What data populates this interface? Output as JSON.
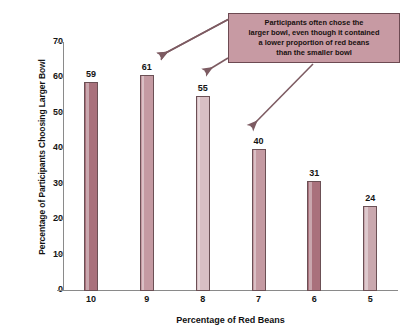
{
  "chart_data": {
    "type": "bar",
    "title": "",
    "xlabel": "Percentage of Red Beans",
    "ylabel": "Percentage of Participants Choosing Larger Bowl",
    "categories": [
      "10",
      "9",
      "8",
      "7",
      "6",
      "5"
    ],
    "values": [
      59,
      61,
      55,
      40,
      31,
      24
    ],
    "bar_colors": [
      "#a9717c",
      "#c49aa2",
      "#d9bfc4",
      "#c49aa2",
      "#a9717c",
      "#c9a8ae"
    ],
    "ylim": [
      0,
      70
    ],
    "ytick_labels": [
      "0",
      "10",
      "20",
      "30",
      "40",
      "50",
      "60",
      "70"
    ],
    "ytick_values": [
      0,
      10,
      20,
      30,
      40,
      50,
      60,
      70
    ],
    "grid": false,
    "legend": "none",
    "annotations": [
      {
        "text": "Participants often chose the\nlarger bowl, even though it contained\na lower proportion of red beans\nthan the smaller bowl",
        "points_to": [
          "9",
          "8",
          "7"
        ]
      }
    ]
  },
  "axes": {
    "y_title": "Percentage of Participants Choosing Larger Bowl",
    "x_title": "Percentage of Red Beans"
  },
  "callout": {
    "text": "Participants often chose the\nlarger bowl, even though it contained\na lower proportion of red beans\nthan the smaller bowl",
    "fill_color": "#c79aa3",
    "border_color": "#6d4a52",
    "arrow_color": "#7d5b62"
  }
}
